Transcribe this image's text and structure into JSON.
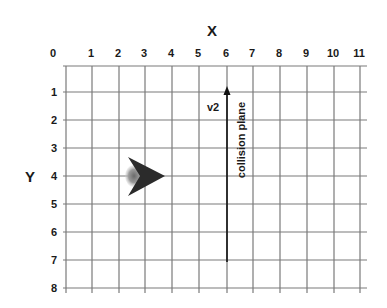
{
  "diagram": {
    "x_axis_title": "X",
    "y_axis_title": "Y",
    "x_ticks": [
      "0",
      "1",
      "2",
      "3",
      "4",
      "5",
      "6",
      "7",
      "8",
      "9",
      "10",
      "11"
    ],
    "y_ticks": [
      "1",
      "2",
      "3",
      "4",
      "5",
      "6",
      "7",
      "8"
    ],
    "vector_label": "v2",
    "plane_label": "collision plane",
    "grid": {
      "origin_px": [
        66,
        66
      ],
      "col_px": [
        66,
        92,
        119,
        145,
        172,
        199,
        227,
        253,
        280,
        307,
        334,
        360
      ],
      "row_px": [
        66,
        92,
        120,
        148,
        176,
        204,
        232,
        260,
        288
      ],
      "line_color": "#7a7a7a"
    },
    "object": {
      "shape": "arrowhead",
      "grid_position": [
        4,
        4
      ],
      "direction": "right",
      "color": "#2b2b2b"
    },
    "vector": {
      "grid_x": 6,
      "from_y": 7,
      "to_y": 0.8,
      "direction": "up",
      "color": "#111111"
    }
  }
}
